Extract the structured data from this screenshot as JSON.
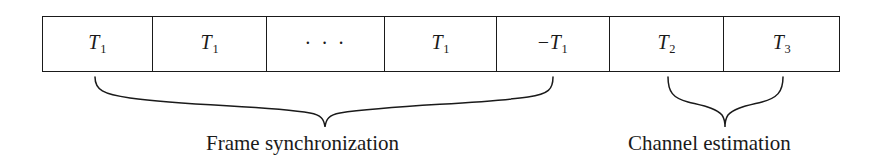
{
  "figure": {
    "name": "frame-structure-diagram",
    "background_color": "#ffffff",
    "line_color": "#1a1a1a"
  },
  "frame": {
    "cells": [
      {
        "id": "cell-1",
        "symbol": "T",
        "subscript": "1",
        "sign": "",
        "type": "symbol",
        "text": "T1"
      },
      {
        "id": "cell-2",
        "symbol": "T",
        "subscript": "1",
        "sign": "",
        "type": "symbol",
        "text": "T1"
      },
      {
        "id": "cell-3",
        "symbol": "",
        "subscript": "",
        "sign": "",
        "type": "ellipsis",
        "text": "· · ·"
      },
      {
        "id": "cell-4",
        "symbol": "T",
        "subscript": "1",
        "sign": "",
        "type": "symbol",
        "text": "T1"
      },
      {
        "id": "cell-5",
        "symbol": "T",
        "subscript": "1",
        "sign": "−",
        "type": "symbol",
        "text": "-T1"
      },
      {
        "id": "cell-6",
        "symbol": "T",
        "subscript": "2",
        "sign": "",
        "type": "symbol",
        "text": "T2"
      },
      {
        "id": "cell-7",
        "symbol": "T",
        "subscript": "3",
        "sign": "",
        "type": "symbol",
        "text": "T3"
      }
    ]
  },
  "annotations": [
    {
      "id": "frame-synchronization",
      "label": "Frame synchronization",
      "spans_cells": "cell-1 through cell-5"
    },
    {
      "id": "channel-estimation",
      "label": "Channel estimation",
      "spans_cells": "cell-6 through cell-7"
    }
  ]
}
